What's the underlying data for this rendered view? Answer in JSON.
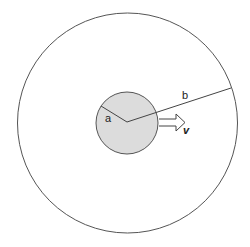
{
  "diagram": {
    "outer_circle": {
      "cx": 127.5,
      "cy": 123,
      "r": 110,
      "stroke": "#555555",
      "fill": "#ffffff"
    },
    "inner_circle": {
      "cx": 127,
      "cy": 123,
      "r": 31,
      "stroke": "#555555",
      "fill": "#dcdcdc"
    },
    "center_point": {
      "x": 127,
      "y": 122
    },
    "radius_a": {
      "label": "a",
      "end": {
        "x": 101,
        "y": 106
      }
    },
    "radius_b": {
      "label": "b",
      "end": {
        "x": 231,
        "y": 88
      }
    },
    "velocity_arrow": {
      "label": "v",
      "from_x": 159,
      "to_x": 185,
      "y": 122
    }
  }
}
